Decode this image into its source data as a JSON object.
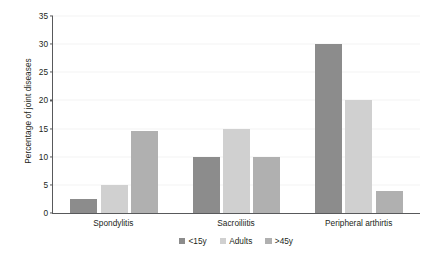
{
  "chart_data": {
    "type": "bar",
    "title": "",
    "xlabel": "",
    "ylabel": "Percentage of joint diseases",
    "categories": [
      "Spondylitis",
      "Sacroiliitis",
      "Peripheral arthirtis"
    ],
    "series": [
      {
        "name": "<15y",
        "color": "#8c8c8c",
        "values": [
          2.5,
          10,
          30
        ]
      },
      {
        "name": "Adults",
        "color": "#d0d0d0",
        "values": [
          5,
          15,
          20
        ]
      },
      {
        "name": ">45y",
        "color": "#b0b0b0",
        "values": [
          14.5,
          10,
          4
        ]
      }
    ],
    "ylim": [
      0,
      35
    ],
    "yticks": [
      0,
      5,
      10,
      15,
      20,
      25,
      30,
      35
    ],
    "ytick_labels": [
      "0",
      "5",
      "10",
      "15",
      "20",
      "25",
      "30",
      "35"
    ],
    "grid": false,
    "legend_position": "bottom-center",
    "axis_color": "#58595b",
    "background": "#ffffff"
  }
}
